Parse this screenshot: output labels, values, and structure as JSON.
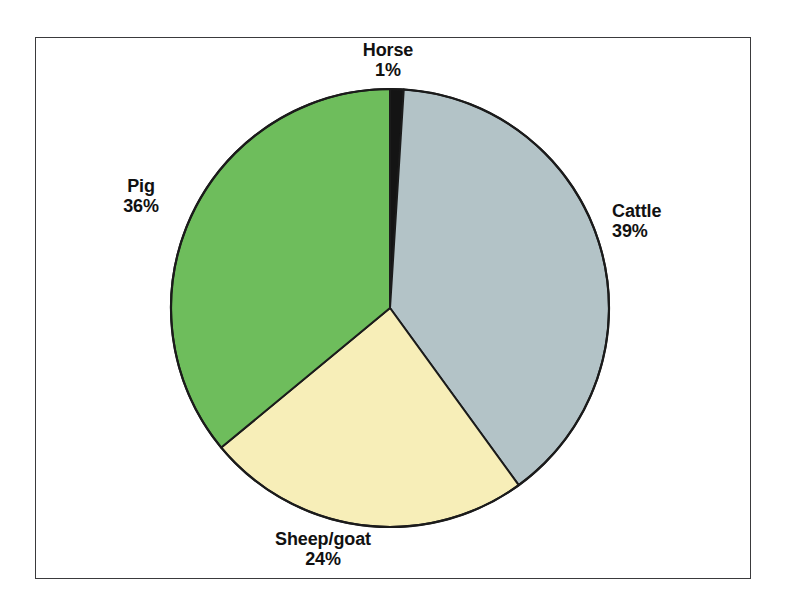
{
  "figure": {
    "frame_border_color": "#3a3a3c",
    "background_color": "#ffffff"
  },
  "chart_data": {
    "type": "pie",
    "title": "",
    "subtitle": "",
    "xlabel": "",
    "ylabel": "",
    "legend_position": "none",
    "grid": false,
    "labels_on_slices": true,
    "start_angle_deg": 0,
    "direction": "clockwise",
    "categories": [
      "Horse",
      "Cattle",
      "Sheep/goat",
      "Pig"
    ],
    "values": [
      1,
      39,
      24,
      36
    ],
    "value_suffix": "%",
    "colors": [
      "#141414",
      "#b3c3c7",
      "#f7eeb8",
      "#6ebd5c"
    ],
    "slice_outline_color": "#1b1b1b",
    "slices": [
      {
        "name": "Horse",
        "value": 1,
        "value_label": "1%",
        "color": "#141414",
        "start_deg": 0,
        "end_deg": 3.6
      },
      {
        "name": "Cattle",
        "value": 39,
        "value_label": "39%",
        "color": "#b3c3c7",
        "start_deg": 3.6,
        "end_deg": 144.0
      },
      {
        "name": "Sheep/goat",
        "value": 24,
        "value_label": "24%",
        "color": "#f7eeb8",
        "start_deg": 144.0,
        "end_deg": 230.4
      },
      {
        "name": "Pig",
        "value": 36,
        "value_label": "36%",
        "color": "#6ebd5c",
        "start_deg": 230.4,
        "end_deg": 360.0
      }
    ]
  },
  "labels": {
    "horse": {
      "name": "Horse",
      "value": "1%"
    },
    "cattle": {
      "name": "Cattle",
      "value": "39%"
    },
    "sheepgoat": {
      "name": "Sheep/goat",
      "value": "24%"
    },
    "pig": {
      "name": "Pig",
      "value": "36%"
    }
  }
}
